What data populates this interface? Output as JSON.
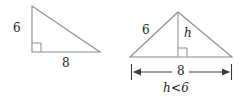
{
  "figure": {
    "stroke_color": "#8a8a8a",
    "dimension_color": "#3a3a3a",
    "text_color": "#1e1e1e",
    "background_color": "#ffffff",
    "left_triangle": {
      "name": "right-triangle",
      "leg_vertical_label": "6",
      "leg_horizontal_label": "8",
      "right_angle_marker": "right-angle-square",
      "vertices": {
        "apex": [
          32,
          6
        ],
        "bottom_left": [
          32,
          52
        ],
        "bottom_right": [
          100,
          52
        ]
      }
    },
    "right_triangle": {
      "name": "oblique-triangle",
      "side_label": "6",
      "height_label": "h",
      "base_label": "8",
      "inequality_label": "h<6",
      "right_angle_marker": "right-angle-square",
      "vertices": {
        "apex": [
          178,
          12
        ],
        "bottom_left": [
          130,
          57
        ],
        "bottom_right": [
          232,
          57
        ]
      },
      "dimension": {
        "y": 72,
        "x_start": 131,
        "x_end": 232
      }
    }
  }
}
